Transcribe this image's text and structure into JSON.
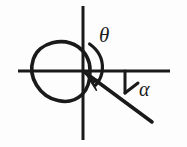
{
  "figure": {
    "background_color": "#fdfdfd",
    "stroke_color": "#1a1a1a",
    "labels": {
      "theta": "θ",
      "alpha": "α"
    },
    "icon_names": {
      "theta_symbol": "theta-symbol",
      "alpha_symbol": "alpha-symbol",
      "rotation_arrow": "rotation-arrow-icon"
    },
    "geometry": {
      "origin": {
        "x": 83,
        "y": 71
      },
      "horizontal_axis": {
        "x1": 18,
        "y1": 71,
        "x2": 170,
        "y2": 71,
        "width": 3
      },
      "vertical_axis": {
        "x1": 83,
        "y1": 6,
        "x2": 83,
        "y2": 140,
        "width": 3
      },
      "circle": {
        "cx": 61,
        "cy": 71,
        "r": 29,
        "width": 3.6,
        "fill": "none"
      },
      "inclined_ray": {
        "x1": 83,
        "y1": 71,
        "x2": 152,
        "y2": 122,
        "width": 3.6
      },
      "alpha_tick": {
        "x1": 125,
        "y1": 71,
        "x2": 125,
        "y2": 92,
        "width": 3
      },
      "alpha_closing_segment": {
        "x1": 125,
        "y1": 92,
        "x2": 137,
        "y2": 83,
        "width": 3
      },
      "theta_arc": {
        "start": {
          "x": 90,
          "y": 44
        },
        "end": {
          "x": 96,
          "y": 84
        },
        "bulge_x": 103,
        "width": 3.2
      },
      "rotation_arrowhead": {
        "tip_x": 88,
        "tip_y": 76,
        "angle_deg": 218,
        "size": 13
      }
    }
  }
}
